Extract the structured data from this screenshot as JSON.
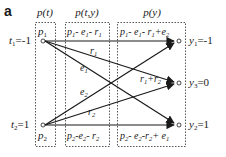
{
  "panel_label": "a",
  "columns": [
    {
      "id": "pt",
      "header": "p(t)"
    },
    {
      "id": "pty",
      "header": "p(t,y)"
    },
    {
      "id": "py",
      "header": "p(y)"
    }
  ],
  "inputs": [
    {
      "id": "t1",
      "label_var": "t",
      "label_sub": "1",
      "label_val": "=-1",
      "box_var": "p",
      "box_sub": "1"
    },
    {
      "id": "t2",
      "label_var": "t",
      "label_sub": "2",
      "label_val": "=1",
      "box_var": "p",
      "box_sub": "2"
    }
  ],
  "outputs": [
    {
      "id": "y1",
      "label_var": "y",
      "label_sub": "1",
      "label_val": "=-1"
    },
    {
      "id": "y3",
      "label_var": "y",
      "label_sub": "3",
      "label_val": "=0"
    },
    {
      "id": "y2",
      "label_var": "y",
      "label_sub": "2",
      "label_val": "=1"
    }
  ],
  "joint": {
    "top": "p1 - e1 - r1",
    "bottom": "p2 - e2 - r2"
  },
  "marginal": {
    "top": "p1 - e1 - r1 + e2",
    "middle": "r1 + r2",
    "bottom": "p2 - e2 - r2 + e1"
  },
  "edges": [
    {
      "from": "t1",
      "to": "y1",
      "label": "",
      "kind": "straight"
    },
    {
      "from": "t1",
      "to": "y3",
      "label": "r1"
    },
    {
      "from": "t1",
      "to": "y2",
      "label": "e1"
    },
    {
      "from": "t2",
      "to": "y1",
      "label": "e2"
    },
    {
      "from": "t2",
      "to": "y3",
      "label": "r2"
    },
    {
      "from": "t2",
      "to": "y2",
      "label": "",
      "kind": "straight"
    }
  ],
  "colors": {
    "line": "#1a1a1a",
    "box": "#555555",
    "text": "#1a1a1a"
  }
}
